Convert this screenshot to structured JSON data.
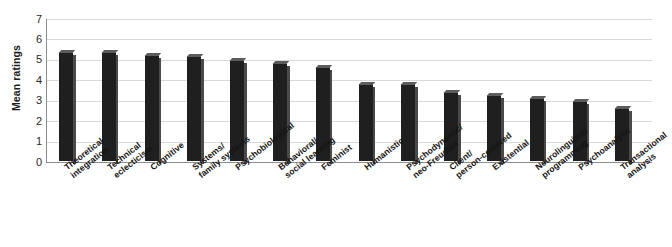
{
  "chart_data": {
    "type": "bar",
    "title": "",
    "xlabel": "",
    "ylabel": "Mean ratings",
    "ylim": [
      0,
      7
    ],
    "yticks": [
      "0",
      "1",
      "2",
      "3",
      "4",
      "5",
      "6",
      "7"
    ],
    "grid": true,
    "legend": "none",
    "bar_color": "#1f1f1f",
    "categories": [
      "Theoretical integration",
      "Technical eclecticism",
      "Cognitive",
      "Systems/ family systems",
      "Psychobiological",
      "Behavioral/ social learning",
      "Feminist",
      "Humanistic",
      "Psychodynamic/ neo-Freudian",
      "Client/ person-centered",
      "Existential",
      "Neurolinguistic programming",
      "Psychoanalytic",
      "Transactional analysis"
    ],
    "category_lines": [
      [
        "Theoretical",
        "integration"
      ],
      [
        "Technical",
        "eclecticism"
      ],
      [
        "Cognitive"
      ],
      [
        "Systems/",
        "family systems"
      ],
      [
        "Psychobiological"
      ],
      [
        "Behavioral/",
        "social learning"
      ],
      [
        "Feminist"
      ],
      [
        "Humanistic"
      ],
      [
        "Psychodynamic/",
        "neo-Freudian"
      ],
      [
        "Client/",
        "person-centered"
      ],
      [
        "Existential"
      ],
      [
        "Neurolinguistic",
        "programming"
      ],
      [
        "Psychoanalytic"
      ],
      [
        "Transactional",
        "analysis"
      ]
    ],
    "values": [
      5.3,
      5.3,
      5.15,
      5.1,
      4.9,
      4.75,
      4.6,
      3.75,
      3.75,
      3.35,
      3.2,
      3.05,
      2.9,
      2.55
    ]
  }
}
